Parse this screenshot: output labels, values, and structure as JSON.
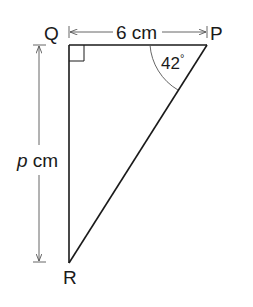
{
  "diagram": {
    "type": "right-triangle",
    "vertices": {
      "Q": {
        "label": "Q",
        "x": 69,
        "y": 45
      },
      "P": {
        "label": "P",
        "x": 207,
        "y": 45
      },
      "R": {
        "label": "R",
        "x": 69,
        "y": 263
      }
    },
    "right_angle_at": "Q",
    "angle_P": {
      "value": "42",
      "unit": "°",
      "text": "42°"
    },
    "side_QP": {
      "length": "6",
      "unit": "cm",
      "text": "6 cm"
    },
    "side_QR": {
      "variable": "p",
      "unit": "cm",
      "italic_part": "p",
      "plain_part": " cm"
    },
    "colors": {
      "line": "#1a1a1a",
      "dim_line": "#555555",
      "background": "#ffffff"
    }
  }
}
